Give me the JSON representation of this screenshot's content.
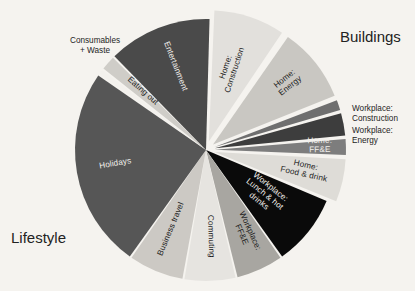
{
  "background_color": "#f5f3ef",
  "group_labels": {
    "lifestyle": "Lifestyle",
    "buildings": "Buildings"
  },
  "external_labels": {
    "consumables": "Consumables\n+ Waste",
    "workplace_construction": "Workplace:\nConstruction",
    "workplace_energy": "Workplace:\nEnergy"
  },
  "chart_data": {
    "type": "pie",
    "title": "",
    "legend_position": "none",
    "groups": [
      "Buildings",
      "Lifestyle"
    ],
    "labels": [
      "Home: Construction",
      "Home: Energy",
      "Workplace: Construction",
      "Workplace: Energy",
      "Home: FF&E",
      "Home: Food & drink",
      "Workplace: Lunch & hot drinks",
      "Workplace: FF&E",
      "Commuting",
      "Business travel",
      "Holidays",
      "Consumables + Waste",
      "Eating out",
      "Entertainment"
    ],
    "values": [
      9.0,
      9.5,
      1.5,
      3.0,
      2.2,
      5.5,
      9.0,
      6.0,
      6.5,
      7.0,
      25.0,
      0.8,
      2.0,
      13.0
    ],
    "colors": [
      "#e2e0dc",
      "#c9c7c2",
      "#6f6f6f",
      "#3d3d3d",
      "#7d7d7d",
      "#dedcd7",
      "#0a0a0a",
      "#a8a6a1",
      "#e6e4e0",
      "#ccc9c4",
      "#565656",
      "#f3f1ed",
      "#cfcdc8",
      "#4a4a4a"
    ],
    "slice_groups": [
      "Buildings",
      "Buildings",
      "Buildings",
      "Buildings",
      "Buildings",
      "Buildings",
      "Lifestyle",
      "Lifestyle",
      "Lifestyle",
      "Lifestyle",
      "Lifestyle",
      "Lifestyle",
      "Lifestyle",
      "Lifestyle"
    ],
    "label_placement": [
      "inside",
      "inside",
      "outside",
      "outside",
      "inside",
      "inside",
      "inside",
      "inside",
      "inside",
      "inside",
      "inside",
      "outside",
      "inside",
      "inside"
    ]
  }
}
